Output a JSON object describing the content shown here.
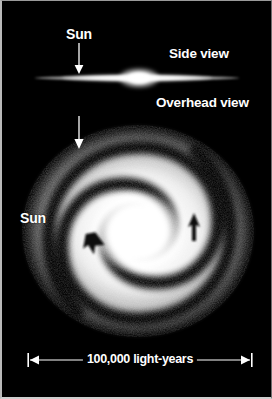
{
  "figure": {
    "background_color": "#000000",
    "label_color": "#ffffff"
  },
  "labels": {
    "side_view": "Side view",
    "overhead_view": "Overhead view",
    "sun_side": "Sun",
    "sun_overhead": "Sun"
  },
  "scale": {
    "caption": "100,000 light-years",
    "value": "100,000",
    "unit": "light-years"
  },
  "annotations": {
    "sun_pointer_side_icon": "down-arrow-icon",
    "sun_pointer_overhead_icon": "down-arrow-icon",
    "rotation_arrow_left_icon": "rotation-arrow-icon",
    "rotation_arrow_right_icon": "rotation-arrow-icon",
    "scale_arrow_left_icon": "left-arrowhead-icon",
    "scale_arrow_right_icon": "right-arrowhead-icon"
  }
}
